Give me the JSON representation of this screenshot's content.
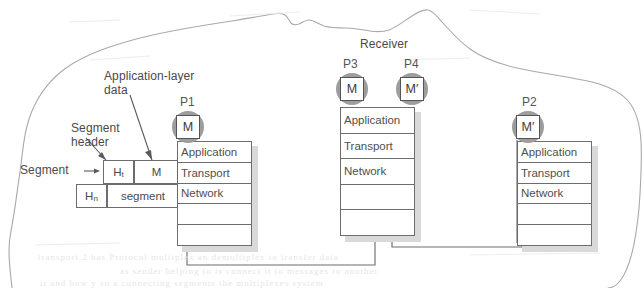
{
  "figure": {
    "title": "Receiver",
    "host_label": "Receiver"
  },
  "annotations": {
    "app_layer_data": "Application-layer\ndata",
    "app_layer_data_line1": "Application-layer",
    "app_layer_data_line2": "data",
    "segment_header_line1": "Segment",
    "segment_header_line2": "header",
    "segment_arrow_label": "Segment →"
  },
  "segment_detail": {
    "transport_header": "H",
    "transport_header_sub": "t",
    "payload": "M",
    "network_header": "H",
    "network_header_sub": "n",
    "segment_word": "segment"
  },
  "processes": [
    {
      "name": "P1",
      "message": "M"
    },
    {
      "name": "P3",
      "message": "M"
    },
    {
      "name": "P4",
      "message": "M′"
    },
    {
      "name": "P2",
      "message": "M′"
    }
  ],
  "stack_layers": {
    "p1": [
      "Application",
      "Transport",
      "Network",
      "",
      ""
    ],
    "mid": [
      "Application",
      "Transport",
      "Network",
      "",
      ""
    ],
    "p2": [
      "Application",
      "Transport",
      "Network",
      "",
      ""
    ]
  },
  "colors": {
    "ink": "#4a4a4a",
    "line": "#6d6d6d",
    "circle_fill": "#9d9d9d",
    "shadow": "#d9d9d9",
    "paper": "#ffffff"
  },
  "ghost_text": {
    "line1": "transport 2 has   Protocol  multiplex  an  demultiplex to  transfer  data",
    "line2": "as sender helping to is connect it to messages to another",
    "line3": "it and how y    so a connecting  segments the multiplexes system"
  }
}
